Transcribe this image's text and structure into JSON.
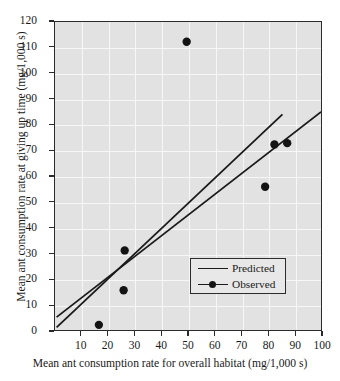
{
  "chart_data": {
    "type": "scatter",
    "title": "",
    "xlabel": "Mean ant consumption rate for overall habitat (mg/1,000 s)",
    "ylabel": "Mean ant consumption rate at giving up time (mg/1,000 s)",
    "xlim": [
      0,
      100
    ],
    "ylim": [
      0,
      120
    ],
    "xticks": [
      10,
      20,
      30,
      40,
      50,
      60,
      70,
      80,
      90,
      100
    ],
    "yticks": [
      0,
      10,
      20,
      30,
      40,
      50,
      60,
      70,
      80,
      90,
      100,
      110,
      120
    ],
    "grid": true,
    "legend_position": "lower-right",
    "series": [
      {
        "name": "Observed",
        "type": "scatter",
        "marker": "filled-circle",
        "color": "#141414",
        "points": [
          {
            "x": 16.5,
            "y": 2.0
          },
          {
            "x": 25.8,
            "y": 15.5
          },
          {
            "x": 26.2,
            "y": 31.0
          },
          {
            "x": 49.5,
            "y": 112.3
          },
          {
            "x": 79.0,
            "y": 55.8
          },
          {
            "x": 82.5,
            "y": 72.3
          },
          {
            "x": 87.3,
            "y": 72.8
          }
        ]
      },
      {
        "name": "Predicted",
        "type": "line",
        "color": "#1a1a1a",
        "lines": [
          {
            "label": "steeper-fit",
            "x0": 0.6,
            "y0": 1.0,
            "x1": 85.5,
            "y1": 84.0
          },
          {
            "label": "shallower-fit",
            "x0": 0.6,
            "y0": 5.0,
            "x1": 100.0,
            "y1": 85.0
          }
        ]
      }
    ],
    "legend": [
      {
        "label": "Predicted",
        "marker": "line"
      },
      {
        "label": "Observed",
        "marker": "line-with-dot"
      }
    ]
  },
  "colors": {
    "plot_background": "#e2e2e2",
    "gridline": "#f7f7f7",
    "axis": "#2b2b2b",
    "ink": "#1a1a1a",
    "page_background": "#ffffff"
  }
}
